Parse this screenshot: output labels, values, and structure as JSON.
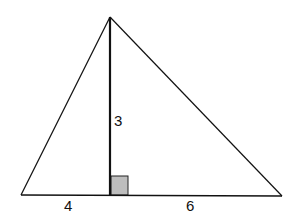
{
  "figure": {
    "type": "triangle-with-altitude",
    "vertices": {
      "apex": [
        110,
        17
      ],
      "left": [
        21,
        195
      ],
      "right": [
        282,
        195
      ]
    },
    "altitude_foot": [
      110,
      195
    ],
    "right_angle_marker": {
      "x": 110,
      "y": 176,
      "size": 18,
      "fill": "#bdbdbd"
    },
    "stroke_color": "#111111",
    "labels": {
      "altitude": "3",
      "left_segment": "4",
      "right_segment": "6"
    }
  }
}
